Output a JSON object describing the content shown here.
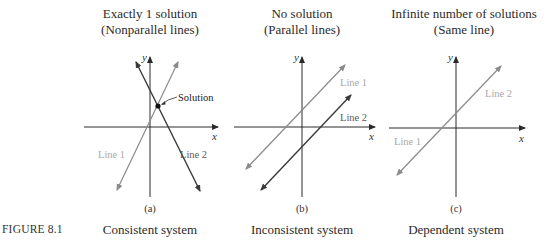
{
  "figure": {
    "label": "FIGURE 8.1"
  },
  "panels": [
    {
      "id": "a",
      "title_line1": "Exactly 1 solution",
      "title_line2": "(Nonparallel lines)",
      "sublabel": "(a)",
      "caption": "Consistent system",
      "axis_x_label": "x",
      "axis_y_label": "y",
      "line1_label": "Line 1",
      "line2_label": "Line 2",
      "annotation": "Solution"
    },
    {
      "id": "b",
      "title_line1": "No solution",
      "title_line2": "(Parallel lines)",
      "sublabel": "(b)",
      "caption": "Inconsistent system",
      "axis_x_label": "x",
      "axis_y_label": "y",
      "line1_label": "Line 1",
      "line2_label": "Line 2"
    },
    {
      "id": "c",
      "title_line1": "Infinite number of solutions",
      "title_line2": "(Same line)",
      "sublabel": "(c)",
      "caption": "Dependent system",
      "axis_x_label": "x",
      "axis_y_label": "y",
      "line1_label": "Line 1",
      "line2_label": "Line 2"
    }
  ],
  "colors": {
    "axis": "#2a2a2a",
    "line1": "#8a8a8a",
    "line2": "#3a3a3a",
    "line1_label": "#a9a9a9",
    "line2_label": "#5a5a5a"
  }
}
